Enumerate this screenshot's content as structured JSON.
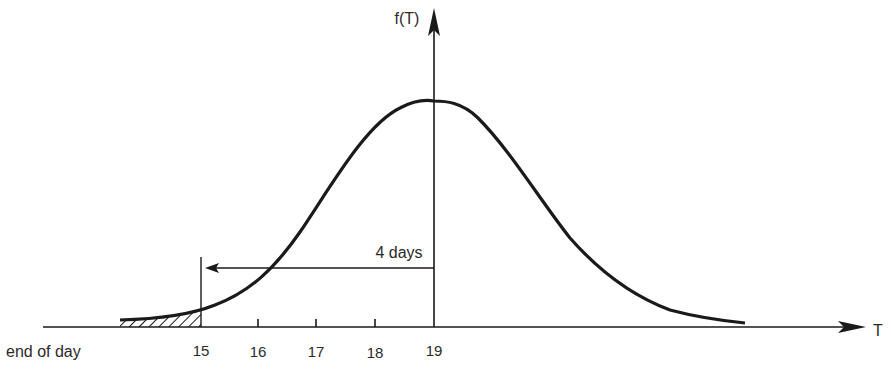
{
  "diagram": {
    "y_axis_label": "f(T)",
    "x_axis_label": "T",
    "x_left_label": "end of day",
    "ticks": [
      {
        "label": "15",
        "x": 201
      },
      {
        "label": "16",
        "x": 258
      },
      {
        "label": "17",
        "x": 316
      },
      {
        "label": "18",
        "x": 375
      },
      {
        "label": "19",
        "x": 434
      }
    ],
    "arrow_label": "4 days",
    "mean": 19,
    "cutoff": 15,
    "shaded_region": "tail left of 15",
    "colors": {
      "line": "#1a1a1a",
      "text": "#2a2a2a",
      "background": "#ffffff"
    }
  }
}
